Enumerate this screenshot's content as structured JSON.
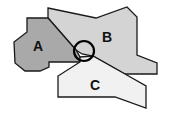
{
  "diagram": {
    "regions": [
      {
        "id": "A",
        "label": "A",
        "fill": "#a9a9a9",
        "points": "27,18 48,18 76,50 80,57 80,62 49,62 49,67 40,71 25,71 15,63 14,42 27,32",
        "label_pos": [
          38,
          46
        ]
      },
      {
        "id": "B",
        "label": "B",
        "fill": "#d4d4d4",
        "points": "48,8 96,18 127,7 137,17 137,55 157,63 157,74 125,74 93,56 82,54 76,50 48,18",
        "label_pos": [
          107,
          37
        ]
      },
      {
        "id": "C",
        "label": "C",
        "fill": "#f1f1f1",
        "points": "80,57 93,56 125,74 146,86 146,108 115,97 58,97 58,76 80,62",
        "label_pos": [
          95,
          85
        ]
      }
    ],
    "stroke_color": "#1a1a1a",
    "junction_circle": {
      "cx": 84,
      "cy": 51,
      "r": 10,
      "stroke": "#000000"
    }
  }
}
